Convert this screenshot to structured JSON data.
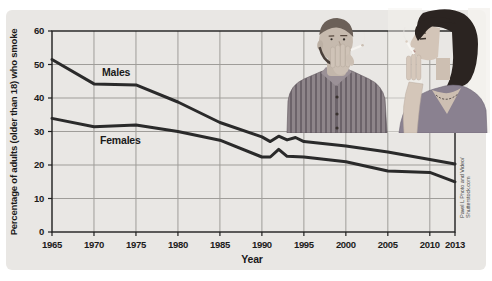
{
  "figure": {
    "credit_line1": "Pavel L Photo and Video/",
    "credit_line2": "Shutterstock.com"
  },
  "chart_data": {
    "type": "line",
    "title": "",
    "ylabel": "Percentage of adults (older than 18) who smoke",
    "xlabel": "Year",
    "xlim": [
      1965,
      2013
    ],
    "ylim": [
      0,
      60
    ],
    "x_ticks": [
      1965,
      1970,
      1975,
      1980,
      1985,
      1990,
      1995,
      2000,
      2005,
      2010,
      2013
    ],
    "y_ticks": [
      0,
      10,
      20,
      30,
      40,
      50,
      60
    ],
    "grid": true,
    "legend_position": "inline labels beside lines",
    "line_color": "#2a2a2a",
    "series": [
      {
        "name": "Males",
        "points": [
          [
            1965,
            51.5
          ],
          [
            1970,
            44.2
          ],
          [
            1975,
            43.9
          ],
          [
            1980,
            38.8
          ],
          [
            1985,
            32.7
          ],
          [
            1990,
            28.4
          ],
          [
            1991,
            27.0
          ],
          [
            1992,
            28.6
          ],
          [
            1993,
            27.5
          ],
          [
            1994,
            28.2
          ],
          [
            1995,
            27.0
          ],
          [
            2000,
            25.7
          ],
          [
            2005,
            23.9
          ],
          [
            2010,
            21.6
          ],
          [
            2013,
            20.3
          ]
        ]
      },
      {
        "name": "Females",
        "points": [
          [
            1965,
            33.9
          ],
          [
            1970,
            31.4
          ],
          [
            1975,
            31.9
          ],
          [
            1980,
            30.0
          ],
          [
            1985,
            27.4
          ],
          [
            1990,
            22.4
          ],
          [
            1991,
            22.4
          ],
          [
            1992,
            24.7
          ],
          [
            1993,
            22.6
          ],
          [
            1995,
            22.4
          ],
          [
            2000,
            21.0
          ],
          [
            2005,
            18.2
          ],
          [
            2010,
            17.8
          ],
          [
            2013,
            15.0
          ]
        ]
      }
    ]
  },
  "colors": {
    "panel_bg": "#e9e7e4",
    "grid": "#9f9d99",
    "frame": "#1f1f1f",
    "line": "#2a2a2a",
    "tick_text": "#1b1b1b",
    "credit_text": "#4b4b4b"
  }
}
